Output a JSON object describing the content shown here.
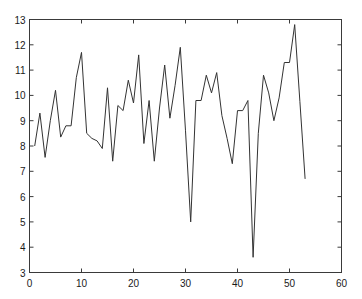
{
  "chart_data": {
    "type": "line",
    "title": "",
    "xlabel": "",
    "ylabel": "",
    "xlim": [
      0,
      60
    ],
    "ylim": [
      3,
      13
    ],
    "grid": false,
    "legend": null,
    "x_ticks": [
      0,
      10,
      20,
      30,
      40,
      50,
      60
    ],
    "y_ticks": [
      3,
      4,
      5,
      6,
      7,
      8,
      9,
      10,
      11,
      12,
      13
    ],
    "series": [
      {
        "name": "series1",
        "color": "#333333",
        "x": [
          1,
          2,
          3,
          4,
          5,
          6,
          7,
          8,
          9,
          10,
          11,
          12,
          13,
          14,
          15,
          16,
          17,
          18,
          19,
          20,
          21,
          22,
          23,
          24,
          25,
          26,
          27,
          28,
          29,
          30,
          31,
          32,
          33,
          34,
          35,
          36,
          37,
          38,
          39,
          40,
          41,
          42,
          43,
          44,
          45,
          46,
          47,
          48,
          49,
          50,
          51,
          52,
          53
        ],
        "values": [
          8.0,
          9.3,
          7.55,
          9.0,
          10.2,
          8.35,
          8.8,
          8.8,
          10.7,
          11.7,
          8.5,
          8.3,
          8.2,
          7.9,
          10.3,
          7.4,
          9.6,
          9.4,
          10.6,
          9.7,
          11.6,
          8.1,
          9.8,
          7.4,
          9.5,
          11.2,
          9.1,
          10.4,
          11.9,
          8.6,
          5.0,
          9.8,
          9.8,
          10.8,
          10.1,
          10.9,
          9.2,
          8.3,
          7.3,
          9.4,
          9.4,
          9.8,
          3.6,
          8.5,
          10.8,
          10.1,
          9.0,
          9.9,
          11.3,
          11.3,
          12.8,
          9.75,
          6.7
        ]
      }
    ]
  },
  "axes": {
    "x_tick_labels": [
      "0",
      "10",
      "20",
      "30",
      "40",
      "50",
      "60"
    ],
    "y_tick_labels": [
      "3",
      "4",
      "5",
      "6",
      "7",
      "8",
      "9",
      "10",
      "11",
      "12",
      "13"
    ]
  }
}
